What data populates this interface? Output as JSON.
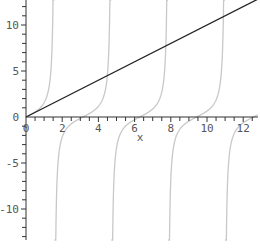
{
  "chart_data": {
    "type": "line",
    "title": "",
    "xlabel": "x",
    "ylabel": "",
    "xlim": [
      0,
      12.8
    ],
    "ylim": [
      -13,
      13
    ],
    "grid": false,
    "legend": null,
    "x_ticks": [
      0,
      2,
      4,
      6,
      8,
      10,
      12
    ],
    "x_tick_labels": [
      "0",
      "2",
      "4",
      "6",
      "8",
      "10",
      "12"
    ],
    "y_ticks": [
      -10,
      -5,
      0,
      5,
      10
    ],
    "y_tick_labels": [
      "-10",
      "-5",
      "0",
      "5",
      "10"
    ],
    "series": [
      {
        "name": "y = x",
        "expression": "x",
        "color": "#222222",
        "style": "solid"
      },
      {
        "name": "y = tan(x)",
        "expression": "tan(x)",
        "color": "#c8c8c8",
        "style": "solid",
        "asymptotes": [
          1.5708,
          4.7124,
          7.854,
          10.9956
        ]
      }
    ]
  }
}
